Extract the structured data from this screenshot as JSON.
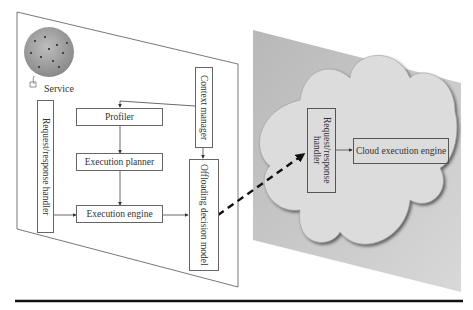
{
  "diagram": {
    "device": {
      "service_label": "Service",
      "components": {
        "request_response_handler": "Request/response handler",
        "profiler": "Profiler",
        "execution_planner": "Execution planner",
        "execution_engine": "Execution engine",
        "context_manager": "Context manager",
        "offloading_decision_model": "Offloading decision model"
      }
    },
    "cloud": {
      "components": {
        "request_response_handler": "Request/response handler",
        "cloud_execution_engine": "Cloud execution engine"
      }
    },
    "edges": [
      {
        "from": "context_manager",
        "to": "profiler",
        "style": "solid"
      },
      {
        "from": "context_manager",
        "to": "offloading_decision_model",
        "style": "solid"
      },
      {
        "from": "profiler",
        "to": "execution_planner",
        "style": "solid"
      },
      {
        "from": "execution_planner",
        "to": "execution_engine",
        "style": "solid"
      },
      {
        "from": "request_response_handler",
        "to": "execution_engine",
        "style": "solid"
      },
      {
        "from": "execution_engine",
        "to": "offloading_decision_model",
        "style": "solid"
      },
      {
        "from": "offloading_decision_model",
        "to": "cloud.request_response_handler",
        "style": "dashed"
      },
      {
        "from": "cloud.request_response_handler",
        "to": "cloud_execution_engine",
        "style": "solid"
      }
    ],
    "colors": {
      "panel_stroke": "#555555",
      "cloud_panel_fill": "#c8c8c8",
      "cloud_fill": "#dcdcdc",
      "rule": "#111111"
    }
  }
}
